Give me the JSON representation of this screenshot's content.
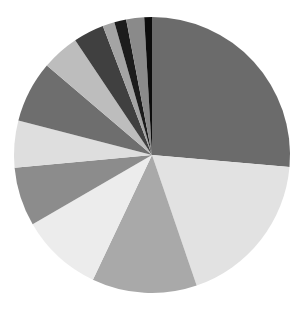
{
  "chart_data": {
    "type": "pie",
    "title": "",
    "start_angle_deg": -90,
    "direction": "clockwise",
    "center": [
      152,
      155
    ],
    "radius": 138,
    "legend": "none",
    "slices": [
      {
        "label": "",
        "value": 26.4,
        "color": "#6b6b6b"
      },
      {
        "label": "",
        "value": 18.4,
        "color": "#e2e2e2"
      },
      {
        "label": "",
        "value": 12.3,
        "color": "#a9a9a9"
      },
      {
        "label": "",
        "value": 9.6,
        "color": "#ececec"
      },
      {
        "label": "",
        "value": 6.9,
        "color": "#8c8c8c"
      },
      {
        "label": "",
        "value": 5.5,
        "color": "#dedede"
      },
      {
        "label": "",
        "value": 7.2,
        "color": "#6e6e6e"
      },
      {
        "label": "",
        "value": 4.4,
        "color": "#bdbdbd"
      },
      {
        "label": "",
        "value": 3.6,
        "color": "#404040"
      },
      {
        "label": "",
        "value": 1.4,
        "color": "#a4a4a4"
      },
      {
        "label": "",
        "value": 1.4,
        "color": "#1c1c1c"
      },
      {
        "label": "",
        "value": 2.1,
        "color": "#8a8a8a"
      },
      {
        "label": "",
        "value": 0.9,
        "color": "#0d0d0d"
      }
    ],
    "values": [
      26.4,
      18.4,
      12.3,
      9.6,
      6.9,
      5.5,
      7.2,
      4.4,
      3.6,
      1.4,
      1.4,
      2.1,
      0.9
    ]
  }
}
